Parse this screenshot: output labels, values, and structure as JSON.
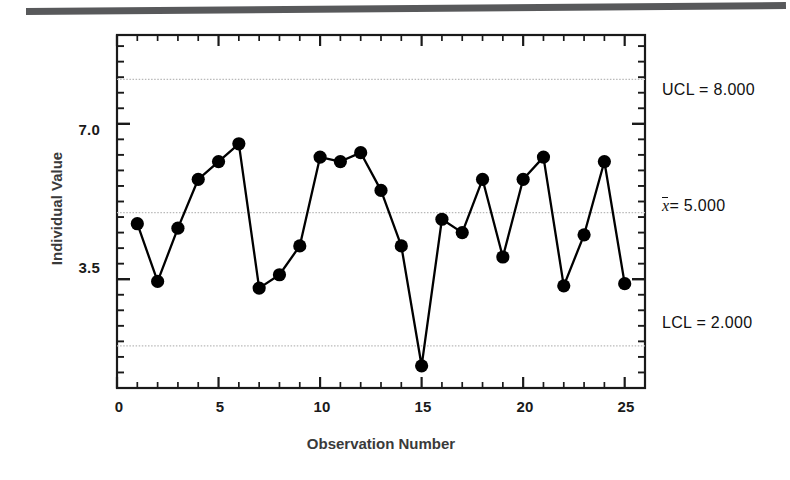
{
  "figure": {
    "kind": "individuals-control-chart",
    "top_rule_color": "#58595b",
    "background_color": "#ffffff"
  },
  "chart_data": {
    "type": "line",
    "title": "",
    "subtitle": "",
    "xlabel": "Observation Number",
    "ylabel": "Individual Value",
    "xlim": [
      0,
      26
    ],
    "ylim": [
      1.05,
      9.0
    ],
    "grid": true,
    "legend_position": "none",
    "x_major_ticks": [
      0,
      5,
      10,
      15,
      20,
      25
    ],
    "x_major_tick_labels": [
      "0",
      "5",
      "10",
      "15",
      "20",
      "25"
    ],
    "x_minor_tick_step": 1,
    "y_major_ticks": [
      3.5,
      7.0
    ],
    "y_major_tick_labels": [
      "3.5",
      "7.0"
    ],
    "y_minor_tick_step": 0.35,
    "marker": "filled-circle",
    "marker_color": "#000000",
    "line_color": "#000000",
    "x": [
      1,
      2,
      3,
      4,
      5,
      6,
      7,
      8,
      9,
      10,
      11,
      12,
      13,
      14,
      15,
      16,
      17,
      18,
      19,
      20,
      21,
      22,
      23,
      24,
      25
    ],
    "values": [
      4.75,
      3.45,
      4.65,
      5.75,
      6.15,
      6.55,
      3.3,
      3.6,
      4.25,
      6.25,
      6.15,
      6.35,
      5.5,
      4.25,
      1.55,
      4.85,
      4.55,
      5.75,
      4.0,
      5.75,
      6.25,
      3.35,
      4.5,
      6.15,
      3.4
    ],
    "control_lines": [
      {
        "name": "UCL",
        "label": "UCL = 8.000",
        "value": 8.0,
        "style": "dotted",
        "color": "#b9b9b9"
      },
      {
        "name": "CL",
        "label": "x̄ = 5.000",
        "value": 5.0,
        "style": "dotted",
        "color": "#b9b9b9"
      },
      {
        "name": "LCL",
        "label": "LCL = 2.000",
        "value": 2.0,
        "style": "dotted",
        "color": "#b9b9b9"
      }
    ]
  },
  "labels": {
    "y_tick_7": "7.0",
    "y_tick_35": "3.5",
    "x_tick_0": "0",
    "x_tick_5": "5",
    "x_tick_10": "10",
    "x_tick_15": "15",
    "x_tick_20": "20",
    "x_tick_25": "25",
    "y_axis_title": "Individual Value",
    "x_axis_title": "Observation Number",
    "ucl_label": "UCL = 8.000",
    "cl_symbol": "x",
    "cl_value": "= 5.000",
    "lcl_label": "LCL = 2.000"
  }
}
